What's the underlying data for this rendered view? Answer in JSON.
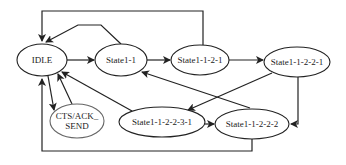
{
  "diagram": {
    "type": "state-machine",
    "nodes": [
      {
        "id": "idle",
        "label": "IDLE",
        "cx": 42,
        "cy": 60,
        "rx": 25,
        "ry": 16,
        "lines": [
          "IDLE"
        ]
      },
      {
        "id": "s11",
        "label": "State1-1",
        "cx": 121,
        "cy": 60,
        "rx": 26,
        "ry": 16,
        "lines": [
          "State1-1"
        ]
      },
      {
        "id": "s1121",
        "label": "State1-1-2-1",
        "cx": 200,
        "cy": 60,
        "rx": 29,
        "ry": 15,
        "lines": [
          "State1-1-2-1"
        ]
      },
      {
        "id": "s11221",
        "label": "State1-1-2-2-1",
        "cx": 297,
        "cy": 62,
        "rx": 33,
        "ry": 15,
        "lines": [
          "State1-1-2-2-1"
        ]
      },
      {
        "id": "cts",
        "label": "CTS/ACK_SEND",
        "cx": 77,
        "cy": 121,
        "rx": 27,
        "ry": 17,
        "lines": [
          "CTS/ACK_",
          "SEND"
        ]
      },
      {
        "id": "s112231",
        "label": "State1-1-2-2-3-1",
        "cx": 162,
        "cy": 122,
        "rx": 43,
        "ry": 15,
        "lines": [
          "State1-1-2-2-3-1"
        ]
      },
      {
        "id": "s11222",
        "label": "State1-1-2-2-2",
        "cx": 252,
        "cy": 124,
        "rx": 37,
        "ry": 15,
        "lines": [
          "State1-1-2-2-2"
        ]
      }
    ],
    "edges": [
      {
        "from": "idle",
        "to": "s11"
      },
      {
        "from": "s11",
        "to": "s1121"
      },
      {
        "from": "s1121",
        "to": "s11221"
      },
      {
        "from": "s11",
        "to": "idle"
      },
      {
        "from": "s1121",
        "to": "idle"
      },
      {
        "from": "idle",
        "to": "cts"
      },
      {
        "from": "cts",
        "to": "idle"
      },
      {
        "from": "s112231",
        "to": "idle"
      },
      {
        "from": "s11221",
        "to": "s112231"
      },
      {
        "from": "s11221",
        "to": "s11222"
      },
      {
        "from": "s112231",
        "to": "s11222"
      },
      {
        "from": "s11222",
        "to": "s11"
      },
      {
        "from": "s11222",
        "to": "idle"
      }
    ]
  }
}
